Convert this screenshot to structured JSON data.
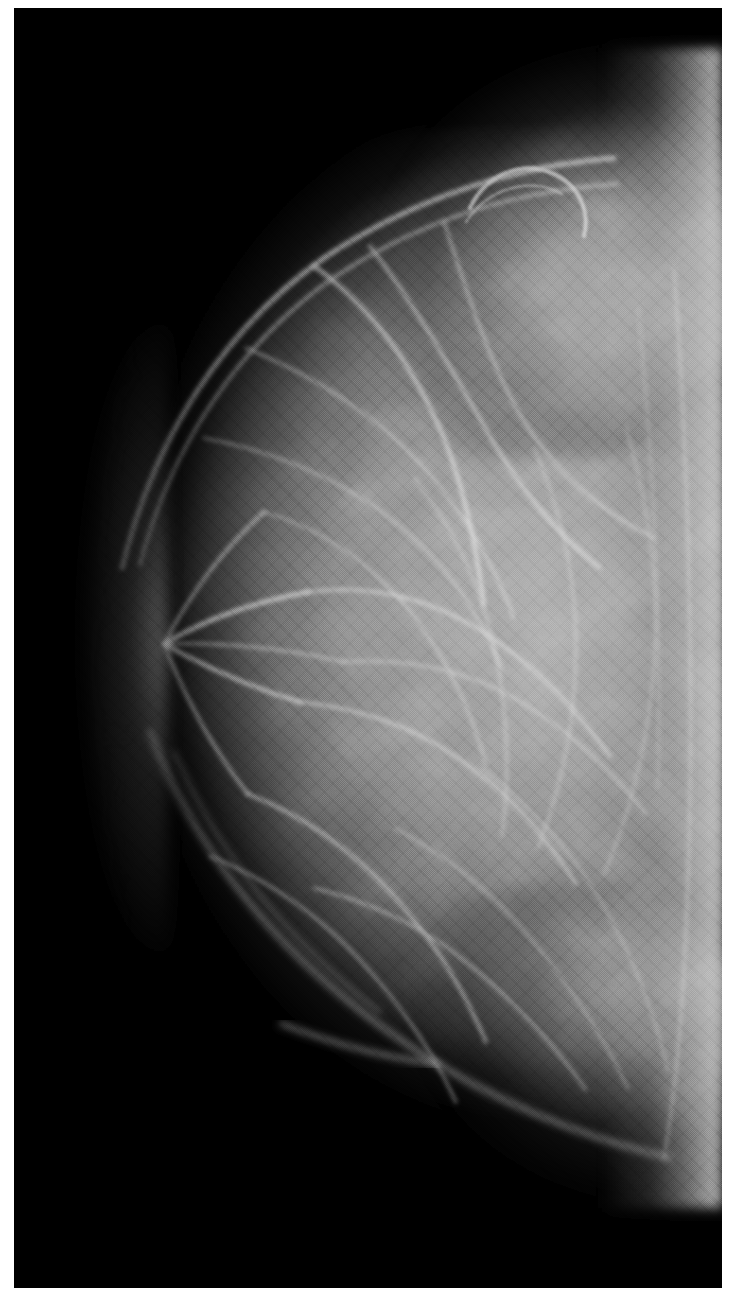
{
  "image": {
    "kind": "medical-radiograph",
    "modality": "mammogram",
    "orientation": "breast projected with nipple to the left and chest wall to the right",
    "width_px": 733,
    "height_px": 1304,
    "has_text_overlay": false,
    "has_annotations": false,
    "has_scale_bar": false,
    "colors": {
      "page_background": "#ffffff",
      "plate_background": "#000000",
      "tissue_midtone": "#8a8a8a",
      "tissue_bright": "#c8c8c8",
      "tissue_peak_highlight": "#e2e2e2",
      "tissue_shadow": "#3c3c3c",
      "border": "#ffffff"
    },
    "frame": {
      "border_top_px": 8,
      "border_left_px": 14,
      "border_right_px": 11,
      "border_bottom_px": 16,
      "plate_width_px": 708,
      "plate_height_px": 1280
    },
    "regions": [
      {
        "name": "background-air",
        "description": "uniform black field occupying the left and lower-left of the plate"
      },
      {
        "name": "breast-parenchyma",
        "description": "large mid-gray soft-tissue mass filling the right two thirds of the plate"
      },
      {
        "name": "skin-and-nipple-line",
        "description": "darker rim along the anterior (left) convex breast border"
      },
      {
        "name": "axillary-tail",
        "description": "tissue extension sweeping toward the upper right corner"
      },
      {
        "name": "inframammary-fold",
        "description": "tissue tapering toward the lower right corner"
      },
      {
        "name": "chest-wall-edge",
        "description": "bright vertical band hugging the right edge of the plate"
      },
      {
        "name": "fibroglandular-strands",
        "description": "bright branching linear densities (Cooper's ligaments / trabeculae) crossing the parenchyma"
      },
      {
        "name": "skin-fold-arc",
        "description": "small curved bright arc near the upper breast contour"
      }
    ],
    "texture": {
      "halftone_screen": true,
      "halftone_angle_deg": 45,
      "film_grain": true,
      "note": "scanned halftone print reproduction"
    }
  }
}
